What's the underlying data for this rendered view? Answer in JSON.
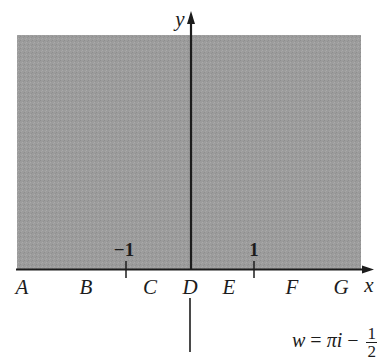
{
  "figure": {
    "type": "complex-plane-region-diagram",
    "shaded_region": {
      "description": "shaded rectangular region above the real axis",
      "fill_color": "#9c9c9c",
      "x_left_px": 17,
      "x_right_px": 361,
      "y_top_px": 35,
      "y_bottom_px": 269
    },
    "axes": {
      "x_label": "x",
      "y_label": "y",
      "color": "#1c1c1c"
    },
    "ticks": [
      {
        "label": "−1",
        "value": -1
      },
      {
        "label": "1",
        "value": 1
      }
    ],
    "boundary_points": [
      {
        "label": "A"
      },
      {
        "label": "B"
      },
      {
        "label": "C"
      },
      {
        "label": "D"
      },
      {
        "label": "E"
      },
      {
        "label": "F"
      },
      {
        "label": "G"
      }
    ],
    "formula": {
      "lhs": "w",
      "equals": "=",
      "term1": "πi",
      "minus": "−",
      "fraction_numerator": "1",
      "fraction_denominator": "2",
      "full_text": "w = πi − 1/2"
    }
  }
}
